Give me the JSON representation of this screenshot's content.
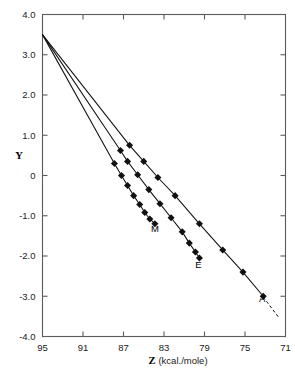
{
  "chart_data": {
    "type": "line",
    "title": "",
    "xlabel": "Z (kcal./mole)",
    "xlabel_symbol": "Z",
    "xlabel_unit": "(kcal./mole)",
    "ylabel": "Y",
    "xlim": [
      95,
      71
    ],
    "ylim": [
      -4.0,
      4.0
    ],
    "x_ticks": [
      95,
      91,
      87,
      83,
      79,
      75,
      71
    ],
    "x_tick_labels": [
      "95",
      "91",
      "87",
      "83",
      "79",
      "75",
      "71"
    ],
    "y_ticks": [
      4.0,
      3.0,
      2.0,
      1.0,
      0,
      -1.0,
      -2.0,
      -3.0,
      -4.0
    ],
    "y_tick_labels": [
      "4.0",
      "3.0",
      "2.0",
      "1.0",
      "0",
      "-1.0",
      "-2.0",
      "-3.0",
      "-4.0"
    ],
    "grid": false,
    "legend": "inline-end-labels",
    "x_axis_inverted": true,
    "convergence_point": {
      "x": 95.0,
      "y": 3.5
    },
    "series": [
      {
        "name": "A",
        "label": "A",
        "label_point": {
          "x": 73.3,
          "y": -3.15
        },
        "marker": "filled-square",
        "has_dashed_extension": true,
        "dashed_extension": [
          {
            "x": 73.2,
            "y": -3.02
          },
          {
            "x": 71.6,
            "y": -3.55
          }
        ],
        "points": [
          {
            "x": 95.0,
            "y": 3.5
          },
          {
            "x": 86.4,
            "y": 0.75
          },
          {
            "x": 85.0,
            "y": 0.35
          },
          {
            "x": 83.6,
            "y": -0.05
          },
          {
            "x": 81.9,
            "y": -0.5
          },
          {
            "x": 79.5,
            "y": -1.2
          },
          {
            "x": 77.2,
            "y": -1.85
          },
          {
            "x": 75.2,
            "y": -2.4
          },
          {
            "x": 73.2,
            "y": -3.0
          }
        ]
      },
      {
        "name": "E",
        "label": "E",
        "label_point": {
          "x": 79.6,
          "y": -2.3
        },
        "marker": "filled-square",
        "has_dashed_extension": false,
        "points": [
          {
            "x": 95.0,
            "y": 3.5
          },
          {
            "x": 87.3,
            "y": 0.62
          },
          {
            "x": 86.6,
            "y": 0.35
          },
          {
            "x": 85.6,
            "y": 0.02
          },
          {
            "x": 84.5,
            "y": -0.35
          },
          {
            "x": 83.4,
            "y": -0.7
          },
          {
            "x": 82.3,
            "y": -1.05
          },
          {
            "x": 81.2,
            "y": -1.4
          },
          {
            "x": 80.5,
            "y": -1.68
          },
          {
            "x": 79.9,
            "y": -1.9
          },
          {
            "x": 79.5,
            "y": -2.05
          }
        ]
      },
      {
        "name": "M",
        "label": "M",
        "label_point": {
          "x": 83.9,
          "y": -1.4
        },
        "marker": "filled-square",
        "has_dashed_extension": false,
        "points": [
          {
            "x": 95.0,
            "y": 3.5
          },
          {
            "x": 87.9,
            "y": 0.3
          },
          {
            "x": 87.2,
            "y": 0.0
          },
          {
            "x": 86.6,
            "y": -0.25
          },
          {
            "x": 86.0,
            "y": -0.5
          },
          {
            "x": 85.4,
            "y": -0.72
          },
          {
            "x": 84.9,
            "y": -0.92
          },
          {
            "x": 84.4,
            "y": -1.08
          },
          {
            "x": 83.9,
            "y": -1.2
          }
        ]
      }
    ]
  }
}
